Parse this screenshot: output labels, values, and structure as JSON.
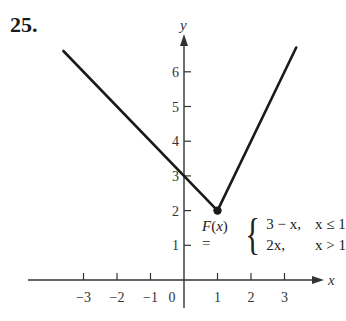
{
  "problem": {
    "number": "25."
  },
  "chart_data": {
    "type": "line",
    "title": "",
    "xlabel": "x",
    "ylabel": "y",
    "x_ticks": [
      -3,
      -2,
      -1,
      0,
      1,
      2,
      3
    ],
    "x_tick_labels": [
      "−3",
      "−2",
      "−1",
      "0",
      "1",
      "2",
      "3"
    ],
    "y_ticks": [
      1,
      2,
      3,
      4,
      5,
      6
    ],
    "y_tick_labels": [
      "1",
      "2",
      "3",
      "4",
      "5",
      "6"
    ],
    "xlim": [
      -3.9,
      4.2
    ],
    "ylim": [
      -0.6,
      7.5
    ],
    "grid": false,
    "legend": null,
    "series": [
      {
        "name": "3 − x, x ≤ 1",
        "x": [
          -3.6,
          1
        ],
        "y": [
          6.6,
          2
        ]
      },
      {
        "name": "2x, x > 1",
        "x": [
          1,
          3.35
        ],
        "y": [
          2,
          6.7
        ]
      }
    ],
    "points": [
      {
        "x": 1,
        "y": 2,
        "style": "filled",
        "label": "vertex"
      }
    ],
    "annotations": [
      {
        "text": "F(x) = { 3 − x, x ≤ 1 ; 2x, x > 1 }",
        "function_name": "F(x)",
        "cases": [
          {
            "expr": "3 − x,",
            "condition": "x ≤ 1"
          },
          {
            "expr": "2x,",
            "condition": "x > 1"
          }
        ]
      }
    ],
    "colors": {
      "line": "#1a1a1a",
      "axis": "#333333",
      "text": "#333333"
    }
  }
}
